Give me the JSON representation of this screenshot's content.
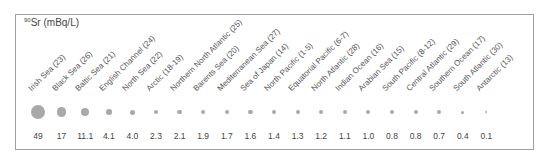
{
  "chart_data": {
    "type": "bubble",
    "title": "90Sr (mBq/L)",
    "title_superscript": "90",
    "title_main": "Sr (mBq/L)",
    "xlabel": "",
    "ylabel": "",
    "categories": [
      "Irish Sea (23)",
      "Black Sea (26)",
      "Baltic Sea (21)",
      "English Channel (24)",
      "North Sea (22)",
      "Arctic (18-19)",
      "Northern North Atlantic (25)",
      "Barents Sea (20)",
      "Mediterranean Sea (27)",
      "Sea of Japan (14)",
      "North Pacific (1-5)",
      "Equatorial Pacific (6-7)",
      "North Atlantic (28)",
      "Indian Ocean (16)",
      "Arabian Sea (15)",
      "South Pacific (8-12)",
      "Central Atlantic (29)",
      "Southern Ocean (17)",
      "South Atlantic (30)",
      "Antarctic (13)"
    ],
    "values": [
      49,
      17,
      11.1,
      4.1,
      4.0,
      2.3,
      2.1,
      1.9,
      1.7,
      1.6,
      1.4,
      1.3,
      1.2,
      1.1,
      1.0,
      0.8,
      0.8,
      0.7,
      0.4,
      0.1
    ],
    "value_labels": [
      "49",
      "17",
      "11.1",
      "4.1",
      "4.0",
      "2.3",
      "2.1",
      "1.9",
      "1.7",
      "1.6",
      "1.4",
      "1.3",
      "1.2",
      "1.1",
      "1.0",
      "0.8",
      "0.8",
      "0.7",
      "0.4",
      "0.1"
    ],
    "marker_color": "#a9a9a9",
    "legend": null
  }
}
